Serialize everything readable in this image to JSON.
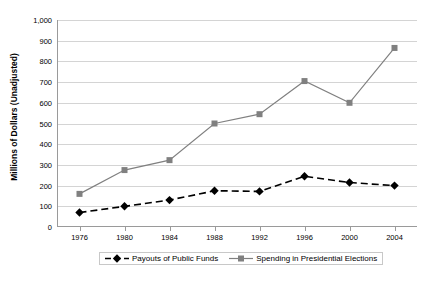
{
  "chart_data": {
    "type": "line",
    "title": "",
    "xlabel": "",
    "ylabel": "Millions of Dollars (Unadjusted)",
    "categories": [
      "1976",
      "1980",
      "1984",
      "1988",
      "1992",
      "1996",
      "2000",
      "2004"
    ],
    "ylim": [
      0,
      1000
    ],
    "ytick_labels": [
      "0",
      "100",
      "200",
      "300",
      "400",
      "500",
      "600",
      "700",
      "800",
      "900",
      "1,000"
    ],
    "ytick_values": [
      0,
      100,
      200,
      300,
      400,
      500,
      600,
      700,
      800,
      900,
      1000
    ],
    "grid": "horizontal",
    "legend_position": "bottom",
    "series": [
      {
        "name": "Payouts of Public Funds",
        "marker": "diamond",
        "line_style": "dashed",
        "color": "#000000",
        "values": [
          70,
          100,
          130,
          175,
          172,
          245,
          215,
          200
        ]
      },
      {
        "name": "Spending in Presidential Elections",
        "marker": "square",
        "line_style": "solid",
        "color": "#808080",
        "values": [
          160,
          275,
          323,
          500,
          545,
          705,
          600,
          865
        ]
      }
    ]
  },
  "colors": {
    "gridline": "#d4d4d4",
    "axis": "#9a9a9a",
    "background": "#ffffff",
    "series_payouts": "#000000",
    "series_spending": "#808080"
  }
}
